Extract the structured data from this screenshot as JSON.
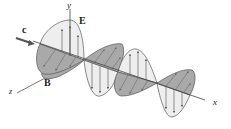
{
  "diagram": {
    "type": "electromagnetic-wave",
    "labels": {
      "y_axis": "y",
      "x_axis": "x",
      "z_axis": "z",
      "electric_field": "E",
      "magnetic_field": "B",
      "speed": "c"
    },
    "colors": {
      "line": "#444444",
      "e_fill": "#eeeeee",
      "b_fill": "#a9a9a9",
      "arrow": "#666666"
    }
  }
}
